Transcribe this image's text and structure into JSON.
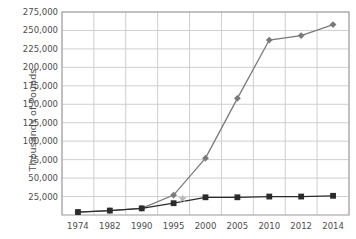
{
  "chart_data": {
    "type": "line",
    "title": "",
    "xlabel": "",
    "ylabel": "Thousands of Pounds",
    "categories": [
      "1974",
      "1982",
      "1990",
      "1995",
      "2000",
      "2005",
      "2010",
      "2012",
      "2014"
    ],
    "ylim": [
      0,
      275000
    ],
    "ytick_labels": [
      "275,000",
      "250,000",
      "225,000",
      "200,000",
      "175,000",
      "150,000",
      "125,000",
      "100,000",
      "75,000",
      "50,000",
      "25,000"
    ],
    "ytick_values": [
      275000,
      250000,
      225000,
      200000,
      175000,
      150000,
      125000,
      100000,
      75000,
      50000,
      25000
    ],
    "ytick_step": 25000,
    "grid": true,
    "legend": "none",
    "series": [
      {
        "name": "series-diamond",
        "marker": "diamond",
        "color": "#7a7a7a",
        "values": [
          4000,
          6000,
          9000,
          27000,
          77000,
          158000,
          237000,
          243000,
          258000
        ]
      },
      {
        "name": "series-square",
        "marker": "square",
        "color": "#2b2b2b",
        "values": [
          4000,
          6000,
          9000,
          16000,
          24000,
          24000,
          25000,
          25000,
          26000
        ]
      }
    ],
    "annotations": [
      {
        "name": "star-marker",
        "marker": "star",
        "color": "#b8b8b8",
        "x": "1995",
        "value": 22000
      }
    ],
    "colors": {
      "grid": "#c9c9c9",
      "axis": "#9a9a9a",
      "text": "#4d4d4d",
      "diamond_series": "#7a7a7a",
      "square_series": "#2b2b2b",
      "star": "#b8b8b8"
    }
  }
}
